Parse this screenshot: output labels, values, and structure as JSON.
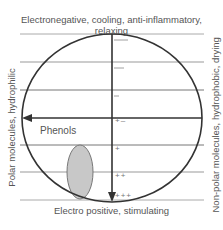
{
  "diagram": {
    "top_label_line1": "Electronegative, cooling, anti-inflammatory,",
    "top_label_line2": "relaxing",
    "bottom_label": "Electro positive, stimulating",
    "left_label": "Polar molecules, hydrophilic",
    "right_label": "Non-polar molecules, hydrophobic, drying",
    "region_label": "Phenols",
    "axis_marks": [
      {
        "text": "—",
        "y": 36
      },
      {
        "text": "–",
        "y": 64
      },
      {
        "text": "–",
        "y": 92
      },
      {
        "text": "+–",
        "y": 118
      },
      {
        "text": "+",
        "y": 146
      },
      {
        "text": "++",
        "y": 172
      },
      {
        "text": "+++",
        "y": 192
      }
    ],
    "colors": {
      "circle": "#333333",
      "lines": "#999999",
      "arrow": "#333333",
      "ellipse_fill": "#c8c8c8",
      "text": "#555555"
    }
  }
}
